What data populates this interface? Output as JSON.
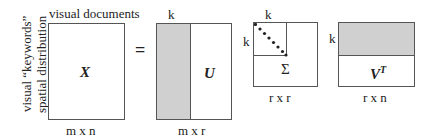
{
  "diagram": {
    "x_matrix": {
      "top_label": "visual documents",
      "side_label_1": "visual “keywords”",
      "side_label_2": "spatial distribution",
      "symbol": "X",
      "dims": "m x n"
    },
    "equals": "=",
    "u_matrix": {
      "top_label": "k",
      "symbol": "U",
      "dims": "m x r"
    },
    "sigma_matrix": {
      "top_label": "k",
      "side_label": "k",
      "symbol": "Σ",
      "dims": "r x r"
    },
    "vt_matrix": {
      "side_label": "k",
      "symbol": "V",
      "superscript": "T",
      "dims": "r x n"
    },
    "colors": {
      "shade": "#d0d0d0",
      "border": "#555555",
      "dots": "#222222"
    }
  }
}
